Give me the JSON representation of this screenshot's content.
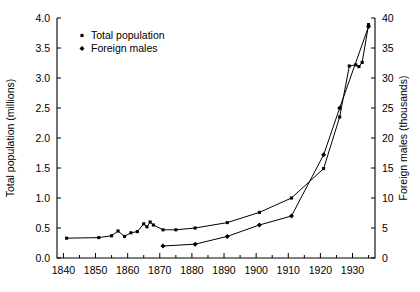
{
  "chart_data": {
    "type": "line",
    "title": "",
    "subtitle": "",
    "xlabel": "",
    "ylabel": "Total population (millions)",
    "y2label": "Foreign males (thousands)",
    "xlim": [
      1838,
      1937
    ],
    "ylim": [
      0.0,
      4.0
    ],
    "y2lim": [
      0,
      40
    ],
    "grid": false,
    "legend_position": "top-left-inside",
    "xticks": [
      1840,
      1850,
      1860,
      1870,
      1880,
      1890,
      1900,
      1910,
      1920,
      1930
    ],
    "xtick_labels": [
      "1840",
      "1850",
      "1860",
      "1870",
      "1880",
      "1890",
      "1900",
      "1910",
      "1920",
      "1930"
    ],
    "xticks_minor": [
      1845,
      1855,
      1865,
      1875,
      1885,
      1895,
      1905,
      1915,
      1925,
      1935
    ],
    "yticks": [
      0.0,
      0.5,
      1.0,
      1.5,
      2.0,
      2.5,
      3.0,
      3.5,
      4.0
    ],
    "ytick_labels": [
      "0.0",
      "0.5",
      "1.0",
      "1.5",
      "2.0",
      "2.5",
      "3.0",
      "3.5",
      "4.0"
    ],
    "y2ticks": [
      0,
      5,
      10,
      15,
      20,
      25,
      30,
      35,
      40
    ],
    "y2tick_labels": [
      "0",
      "5",
      "10",
      "15",
      "20",
      "25",
      "30",
      "35",
      "40"
    ],
    "series": [
      {
        "name": "Total population",
        "axis": "left",
        "marker": "square",
        "color": "#000000",
        "points": [
          [
            1841,
            0.33
          ],
          [
            1851,
            0.34
          ],
          [
            1855,
            0.37
          ],
          [
            1857,
            0.45
          ],
          [
            1859,
            0.36
          ],
          [
            1861,
            0.42
          ],
          [
            1863,
            0.44
          ],
          [
            1865,
            0.57
          ],
          [
            1866,
            0.52
          ],
          [
            1867,
            0.6
          ],
          [
            1868,
            0.55
          ],
          [
            1871,
            0.47
          ],
          [
            1875,
            0.47
          ],
          [
            1881,
            0.5
          ],
          [
            1891,
            0.59
          ],
          [
            1901,
            0.76
          ],
          [
            1911,
            1.0
          ],
          [
            1921,
            1.49
          ],
          [
            1926,
            2.35
          ],
          [
            1929,
            3.2
          ],
          [
            1931,
            3.22
          ],
          [
            1932,
            3.19
          ],
          [
            1933,
            3.26
          ],
          [
            1935,
            3.89
          ]
        ]
      },
      {
        "name": "Foreign males",
        "axis": "right",
        "marker": "diamond",
        "color": "#000000",
        "points": [
          [
            1871,
            2.0
          ],
          [
            1881,
            2.3
          ],
          [
            1891,
            3.6
          ],
          [
            1901,
            5.5
          ],
          [
            1911,
            7.0
          ],
          [
            1921,
            17.2
          ],
          [
            1926,
            25.0
          ],
          [
            1935,
            38.6
          ]
        ]
      }
    ],
    "legend": [
      {
        "label": "Total population",
        "marker": "square"
      },
      {
        "label": "Foreign males",
        "marker": "diamond"
      }
    ]
  },
  "plot": {
    "frame": {
      "left": 57,
      "top": 18,
      "right": 375,
      "bottom": 258
    },
    "frame_color": "#000000"
  }
}
